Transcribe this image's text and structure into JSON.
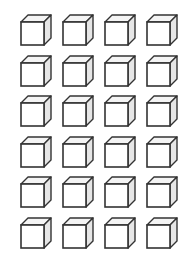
{
  "worksheet": {
    "rows": 6,
    "columns": 4,
    "total_cubes": 24,
    "cube_icon": "cube-outline-icon",
    "colors": {
      "background": "#ffffff",
      "stroke": "#333333",
      "top_face": "#f4f4f4",
      "side_face": "#e6e6e6",
      "front_face": "#ffffff"
    }
  }
}
